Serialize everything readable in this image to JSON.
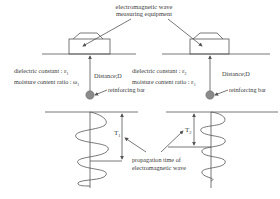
{
  "diagram": {
    "equipment_label_line1": "electromagnetic wave",
    "equipment_label_line2": "measuring equipment",
    "left": {
      "dielectric": "dielectric constant : ε",
      "dielectric_sub": "1",
      "moisture": "moisture content ratio : ω",
      "moisture_sub": "1",
      "distance": "Distance;D",
      "rebar": "reinforcing bar",
      "time_label": "T",
      "time_sub": "1"
    },
    "right": {
      "dielectric": "dielectric constant : ε",
      "dielectric_sub": "2",
      "moisture": "moisture content ratio : ε",
      "moisture_sub": "1",
      "distance": "Distance;D",
      "rebar": "reinforcing bar",
      "time_label": "T",
      "time_sub": "2"
    },
    "propagation_line1": "propagation time of",
    "propagation_line2": "electromagnetic wave",
    "colors": {
      "line": "#555555",
      "rebar_fill": "#8a8a8a",
      "text": "#3a3a3a"
    }
  }
}
